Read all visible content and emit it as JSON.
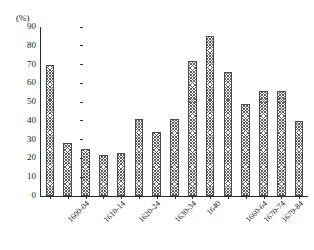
{
  "title_fragment": "",
  "axis": {
    "unit_label": "(%)",
    "y_ticks": [
      "0",
      "10",
      "20",
      "30",
      "40",
      "50",
      "60",
      "70",
      "80",
      "90"
    ]
  },
  "colors": {
    "axis": "#2a2a2a",
    "bar_edge": "#4a4a4a",
    "bar_hatch": "#5c5c5c",
    "background": "#ffffff"
  },
  "chart_data": {
    "type": "bar",
    "title": "",
    "subtitle": "",
    "xlabel": "",
    "ylabel": "(%)",
    "ylim": [
      0,
      90
    ],
    "ytick_step": 10,
    "grid": false,
    "legend": null,
    "legend_position": "none",
    "bar_count": 15,
    "categories": [
      "1600-04",
      "",
      "1610-14",
      "",
      "1620-24",
      "",
      "1630-34",
      "",
      "1640",
      "",
      "1660-64",
      "1670-74",
      "1679-84",
      "",
      "1688-97"
    ],
    "tick_labels": [
      "1600-04",
      "1610-14",
      "1620-24",
      "1630-34",
      "1640",
      "1660-64",
      "1670-74",
      "1679-84",
      "1688-97"
    ],
    "values": [
      70,
      28,
      25,
      22,
      23,
      41,
      34,
      41,
      72,
      85,
      66,
      49,
      56,
      56,
      40
    ]
  }
}
